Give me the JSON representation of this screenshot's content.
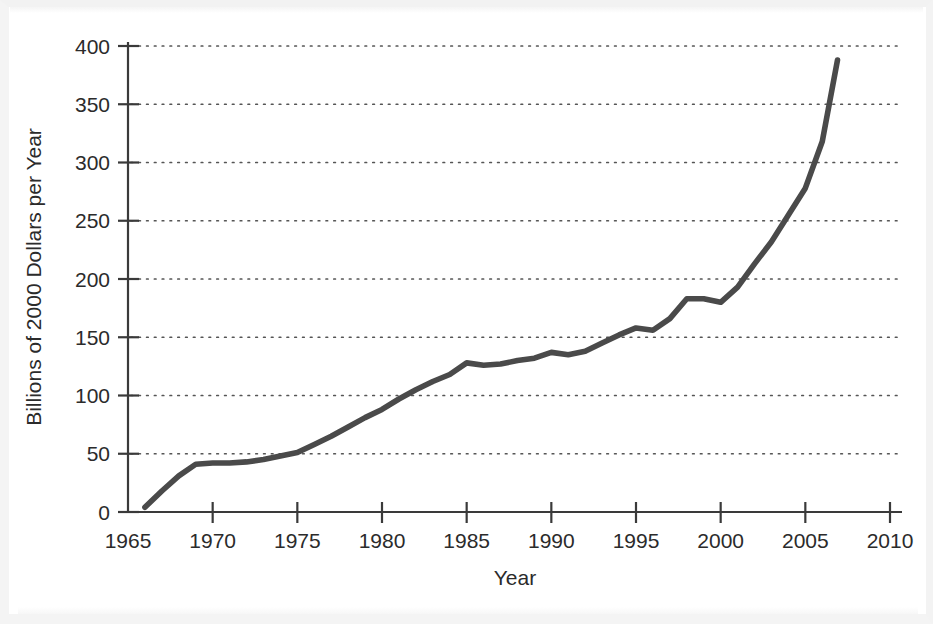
{
  "figure": {
    "background_color": "#ffffff",
    "line_color": "#4a4a4a",
    "text_color": "#2b2b2b",
    "grid_color": "#555555"
  },
  "chart_data": {
    "type": "line",
    "title": "",
    "xlabel": "Year",
    "ylabel": "Billions of 2000 Dollars per Year",
    "xlim": [
      1965,
      2010
    ],
    "ylim": [
      0,
      400
    ],
    "grid": true,
    "grid_axis": "y",
    "legend": "none",
    "xticks": [
      1965,
      1970,
      1975,
      1980,
      1985,
      1990,
      1995,
      2000,
      2005,
      2010
    ],
    "xticklabels": [
      "1965",
      "1970",
      "1975",
      "1980",
      "1985",
      "1990",
      "1995",
      "2000",
      "2005",
      "2010"
    ],
    "yticks": [
      0,
      50,
      100,
      150,
      200,
      250,
      300,
      350,
      400
    ],
    "yticklabels": [
      "0",
      "50",
      "100",
      "150",
      "200",
      "250",
      "300",
      "350",
      "400"
    ],
    "x": [
      1966,
      1967,
      1968,
      1969,
      1970,
      1971,
      1972,
      1973,
      1974,
      1975,
      1976,
      1977,
      1978,
      1979,
      1980,
      1981,
      1982,
      1983,
      1984,
      1985,
      1986,
      1987,
      1988,
      1989,
      1990,
      1991,
      1992,
      1993,
      1994,
      1995,
      1996,
      1997,
      1998,
      1999,
      2000,
      2001,
      2002,
      2003,
      2004,
      2005,
      2006,
      2006.9
    ],
    "y": [
      4,
      18,
      31,
      41,
      42,
      42,
      43,
      45,
      48,
      51,
      58,
      65,
      73,
      81,
      88,
      97,
      105,
      112,
      118,
      128,
      126,
      127,
      130,
      132,
      137,
      135,
      138,
      145,
      152,
      158,
      156,
      166,
      183,
      183,
      180,
      193,
      213,
      232,
      255,
      278,
      318,
      388
    ],
    "series_name": "Spending"
  }
}
